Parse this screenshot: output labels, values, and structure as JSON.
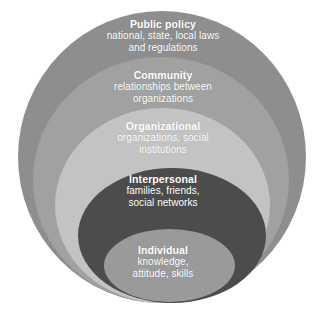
{
  "diagram": {
    "name": "socio-ecological-model",
    "background_color": "#ffffff",
    "levels": [
      {
        "id": "public-policy",
        "title": "Public policy",
        "desc_line1": "national, state, local laws",
        "desc_line2": "and regulations",
        "color": "#8e8e8e",
        "text_color": "#ffffff"
      },
      {
        "id": "community",
        "title": "Community",
        "desc_line1": "relationships between",
        "desc_line2": "organizations",
        "color": "#a1a1a1",
        "text_color": "#ffffff"
      },
      {
        "id": "organizational",
        "title": "Organizational",
        "desc_line1": "organizations, social",
        "desc_line2": "institutions",
        "color": "#c3c3c3",
        "text_color": "#ffffff"
      },
      {
        "id": "interpersonal",
        "title": "Interpersonal",
        "desc_line1": "families, friends,",
        "desc_line2": "social networks",
        "color": "#4c4c4c",
        "text_color": "#ffffff"
      },
      {
        "id": "individual",
        "title": "Individual",
        "desc_line1": "knowledge,",
        "desc_line2": "attitude, skills",
        "color": "#9a9a9a",
        "text_color": "#ffffff"
      }
    ]
  }
}
